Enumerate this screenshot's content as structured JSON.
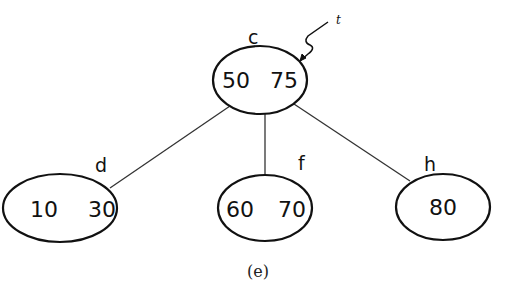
{
  "diagram": {
    "type": "tree",
    "caption": "(e)",
    "pointer": {
      "label": "t",
      "target": "c"
    },
    "nodes": [
      {
        "id": "c",
        "label": "c",
        "keys": [
          "50",
          "75"
        ],
        "cx": 260,
        "cy": 80,
        "rx": 47,
        "ry": 34
      },
      {
        "id": "d",
        "label": "d",
        "keys": [
          "10",
          "30"
        ],
        "cx": 60,
        "cy": 208,
        "rx": 57,
        "ry": 34
      },
      {
        "id": "f",
        "label": "f",
        "keys": [
          "60",
          "70"
        ],
        "cx": 265,
        "cy": 208,
        "rx": 47,
        "ry": 33
      },
      {
        "id": "h",
        "label": "h",
        "keys": [
          "80"
        ],
        "cx": 443,
        "cy": 207,
        "rx": 47,
        "ry": 33
      }
    ],
    "edges": [
      {
        "from": "c",
        "to": "d"
      },
      {
        "from": "c",
        "to": "f"
      },
      {
        "from": "c",
        "to": "h"
      }
    ]
  }
}
